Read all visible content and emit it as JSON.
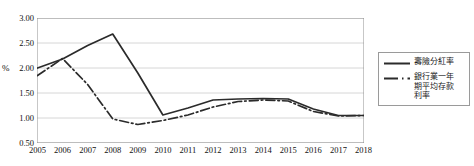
{
  "chart_data": {
    "type": "line",
    "title": "",
    "xlabel": "",
    "ylabel": "%",
    "categories": [
      "2005",
      "2006",
      "2007",
      "2008",
      "2009",
      "2010",
      "2011",
      "2012",
      "2013",
      "2014",
      "2015",
      "2016",
      "2017",
      "2018"
    ],
    "x": [
      2005,
      2006,
      2007,
      2008,
      2009,
      2010,
      2011,
      2012,
      2013,
      2014,
      2015,
      2016,
      2017,
      2018
    ],
    "ylim": [
      0.5,
      3.0
    ],
    "ytick_labels": [
      "3.00",
      "2.50",
      "2.00",
      "1.50",
      "1.00",
      "0.50"
    ],
    "ytick_values": [
      3.0,
      2.5,
      2.0,
      1.5,
      1.0,
      0.5
    ],
    "grid": true,
    "legend_position": "right",
    "series": [
      {
        "name": "壽險分紅率",
        "style": "solid",
        "color": "#2b2b2b",
        "values": [
          2.0,
          2.18,
          2.45,
          2.68,
          1.9,
          1.06,
          1.2,
          1.36,
          1.38,
          1.39,
          1.38,
          1.18,
          1.05,
          1.05
        ]
      },
      {
        "name": "銀行業一年\n期平均存款\n利率",
        "style": "dash-dot",
        "color": "#2b2b2b",
        "values": [
          1.85,
          2.19,
          1.67,
          0.98,
          0.87,
          0.95,
          1.06,
          1.22,
          1.33,
          1.36,
          1.34,
          1.13,
          1.04,
          1.05
        ]
      }
    ]
  },
  "axes": {
    "y_title": "%"
  }
}
